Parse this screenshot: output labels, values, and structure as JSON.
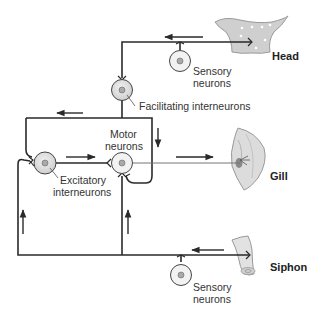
{
  "diagram": {
    "type": "neural-circuit",
    "colors": {
      "wire": "#2a2a2a",
      "cell_fill": "#e6e6e6",
      "cell_fill_dark": "#cfcfcf",
      "nucleus": "#a9a9a9",
      "organ": "#d8d8d8",
      "organ_edge": "#9a9a9a",
      "text": "#333333"
    },
    "organs": {
      "head": "Head",
      "gill": "Gill",
      "siphon": "Siphon"
    },
    "labels": {
      "sensory_top_1": "Sensory",
      "sensory_top_2": "neurons",
      "facilitating": "Facilitating interneurons",
      "motor_1": "Motor",
      "motor_2": "neurons",
      "excitatory_1": "Excitatory",
      "excitatory_2": "interneurons",
      "sensory_bottom_1": "Sensory",
      "sensory_bottom_2": "neurons"
    },
    "nodes": [
      {
        "id": "head-sensory-neuron",
        "label": "Sensory neurons"
      },
      {
        "id": "facilitating-interneuron",
        "label": "Facilitating interneurons"
      },
      {
        "id": "excitatory-interneuron",
        "label": "Excitatory interneurons"
      },
      {
        "id": "motor-neuron",
        "label": "Motor neurons"
      },
      {
        "id": "siphon-sensory-neuron",
        "label": "Sensory neurons"
      }
    ],
    "edges": [
      {
        "from": "Head",
        "to": "head-sensory-neuron"
      },
      {
        "from": "head-sensory-neuron",
        "to": "facilitating-interneuron"
      },
      {
        "from": "facilitating-interneuron",
        "to": "excitatory-interneuron"
      },
      {
        "from": "facilitating-interneuron",
        "to": "motor-neuron"
      },
      {
        "from": "excitatory-interneuron",
        "to": "motor-neuron"
      },
      {
        "from": "motor-neuron",
        "to": "Gill"
      },
      {
        "from": "Siphon",
        "to": "siphon-sensory-neuron"
      },
      {
        "from": "siphon-sensory-neuron",
        "to": "excitatory-interneuron"
      },
      {
        "from": "siphon-sensory-neuron",
        "to": "motor-neuron"
      }
    ]
  }
}
